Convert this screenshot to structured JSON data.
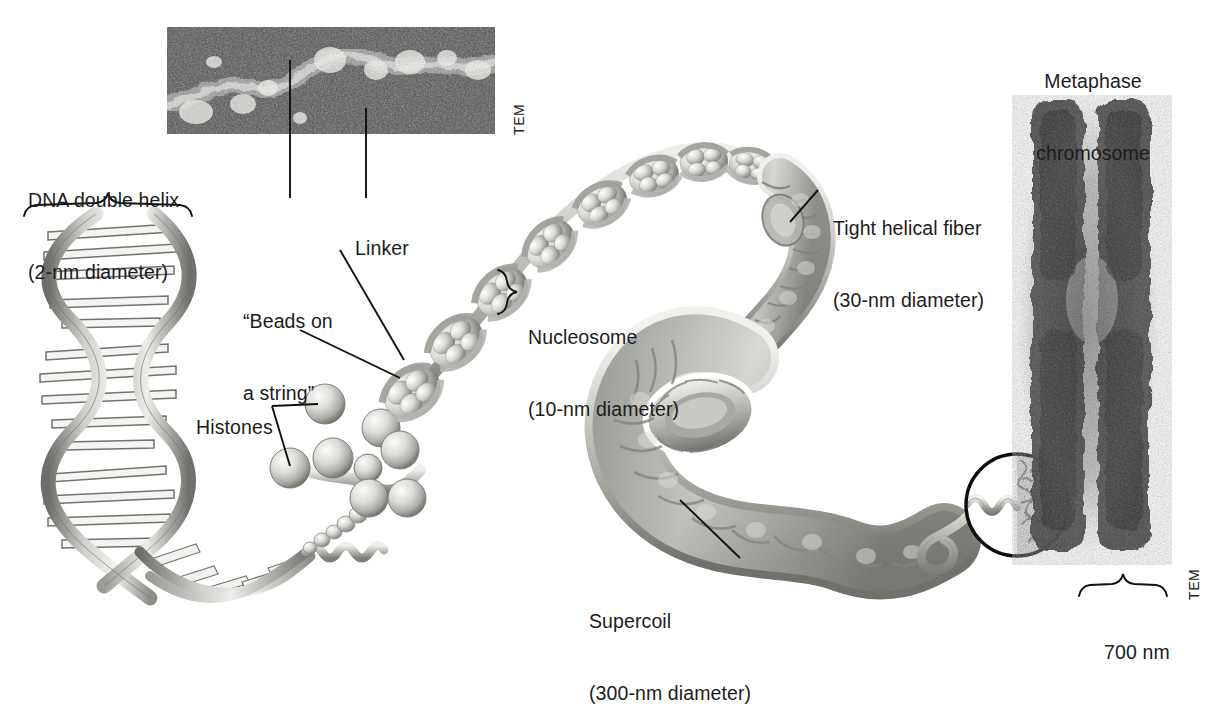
{
  "figure": {
    "type": "biology-illustration"
  },
  "labels": {
    "dna_helix": "DNA double helix\n(2-nm diameter)",
    "dna_helix_line1": "DNA double helix",
    "dna_helix_line2": "(2-nm diameter)",
    "beads_on_a_string": "“Beads on\na string”",
    "beads_line1": "“Beads on",
    "beads_line2": "a string”",
    "linker": "Linker",
    "histones": "Histones",
    "nucleosome": "Nucleosome\n(10-nm diameter)",
    "nucleosome_line1": "Nucleosome",
    "nucleosome_line2": "(10-nm diameter)",
    "tight_helical_fiber": "Tight helical fiber\n(30-nm diameter)",
    "fiber_line1": "Tight helical fiber",
    "fiber_line2": "(30-nm diameter)",
    "supercoil": "Supercoil\n(300-nm diameter)",
    "supercoil_line1": "Supercoil",
    "supercoil_line2": "(300-nm diameter)",
    "metaphase_chromosome": "Metaphase\nchromosome",
    "metaphase_line1": "Metaphase",
    "metaphase_line2": "chromosome",
    "scale_700nm": "700 nm",
    "tem_top": "TEM",
    "tem_right": "TEM"
  },
  "micrographs": [
    {
      "name": "chromatin-beads-on-a-string-tem",
      "credit": "TEM",
      "caption": ""
    },
    {
      "name": "metaphase-chromosome-tem",
      "credit": "TEM",
      "caption": "Metaphase chromosome"
    }
  ],
  "structures": [
    {
      "name": "dna-double-helix",
      "diameter": "2 nm"
    },
    {
      "name": "nucleosome",
      "diameter": "10 nm"
    },
    {
      "name": "tight-helical-fiber",
      "diameter": "30 nm"
    },
    {
      "name": "supercoil",
      "diameter": "300 nm"
    },
    {
      "name": "metaphase-chromosome",
      "width": "700 nm"
    }
  ],
  "colors": {
    "text": "#1c1c1c",
    "leader_line": "#111111",
    "illustration_light": "#e8e8e6",
    "illustration_mid": "#b8b8b4",
    "illustration_dark": "#6f6f6c",
    "micrograph_dark": "#3a3a3a",
    "background": "#ffffff"
  }
}
